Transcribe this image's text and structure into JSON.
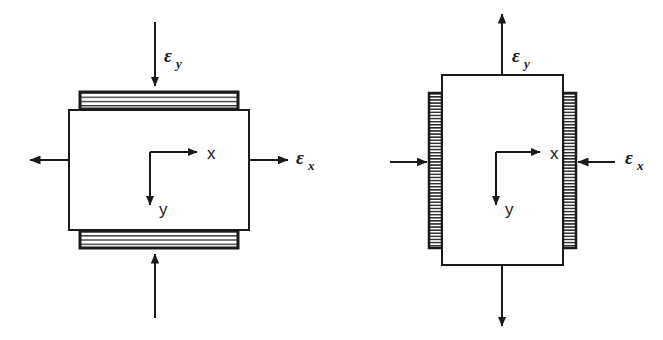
{
  "figure": {
    "type": "engineering-diagram",
    "background_color": "#ffffff",
    "line_color": "#1a1a1a"
  },
  "panels": [
    {
      "id": "left-panel",
      "name": "left-strain-element",
      "element": {
        "shape": "rectangle",
        "x": 69,
        "y": 110,
        "width": 180,
        "height": 120,
        "fill": "#ffffff",
        "stroke": "#1a1a1a"
      },
      "bands": [
        {
          "name": "top-hatched-band",
          "orientation": "horizontal",
          "x": 80,
          "y": 92,
          "width": 158,
          "height": 17
        },
        {
          "name": "bottom-hatched-band",
          "orientation": "horizontal",
          "x": 80,
          "y": 231,
          "width": 158,
          "height": 17
        }
      ],
      "axes": {
        "origin_x": 150,
        "origin_y": 152,
        "x_label": "x",
        "y_label": "y",
        "x_arrow_length": 48,
        "y_arrow_length": 54
      },
      "arrows": [
        {
          "name": "epsilon-y-arrow-top",
          "direction": "down",
          "points_toward": "element",
          "label": "ε",
          "subscript": "y",
          "label_x": 164,
          "label_y": 62
        },
        {
          "name": "epsilon-x-arrow-right",
          "direction": "right",
          "points_toward": "outward",
          "label": "ε",
          "subscript": "x",
          "label_x": 296,
          "label_y": 164
        },
        {
          "name": "epsilon-x-arrow-left",
          "direction": "left",
          "points_toward": "outward",
          "label": "",
          "subscript": ""
        },
        {
          "name": "epsilon-y-arrow-bottom",
          "direction": "up",
          "points_toward": "element",
          "label": "",
          "subscript": ""
        }
      ]
    },
    {
      "id": "right-panel",
      "name": "right-strain-element",
      "element": {
        "shape": "rectangle",
        "x": 442,
        "y": 75,
        "width": 121,
        "height": 190,
        "fill": "#ffffff",
        "stroke": "#1a1a1a"
      },
      "bands": [
        {
          "name": "left-hatched-band",
          "orientation": "vertical",
          "x": 429,
          "y": 93,
          "width": 13,
          "height": 155
        },
        {
          "name": "right-hatched-band",
          "orientation": "vertical",
          "x": 563,
          "y": 93,
          "width": 13,
          "height": 155
        }
      ],
      "axes": {
        "origin_x": 496,
        "origin_y": 152,
        "x_label": "x",
        "y_label": "y",
        "x_arrow_length": 48,
        "y_arrow_length": 54
      },
      "arrows": [
        {
          "name": "epsilon-y-arrow-top",
          "direction": "up",
          "points_toward": "outward",
          "label": "ε",
          "subscript": "y",
          "label_x": 512,
          "label_y": 62
        },
        {
          "name": "epsilon-x-arrow-right",
          "direction": "left",
          "points_toward": "element",
          "label": "ε",
          "subscript": "x",
          "label_x": 625,
          "label_y": 164
        },
        {
          "name": "epsilon-x-arrow-left",
          "direction": "right",
          "points_toward": "element",
          "label": "",
          "subscript": ""
        },
        {
          "name": "epsilon-y-arrow-bottom",
          "direction": "down",
          "points_toward": "outward",
          "label": "",
          "subscript": ""
        }
      ]
    }
  ],
  "labels": {
    "epsilon": "ε",
    "sub_x": "x",
    "sub_y": "y",
    "axis_x": "x",
    "axis_y": "y"
  }
}
